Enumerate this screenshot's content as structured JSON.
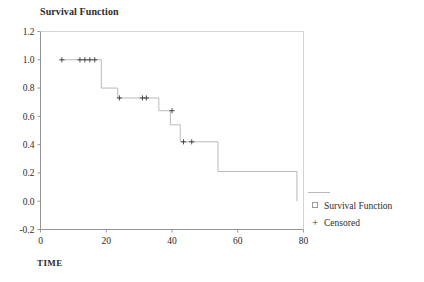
{
  "chart": {
    "title": "Survival Function",
    "xlabel": "TIME",
    "ylabel": ""
  },
  "legend": {
    "series_label": "Survival Function",
    "censored_label": "Censored",
    "censored_symbol": "+",
    "position": "right"
  },
  "axes": {
    "x_ticks": [
      "0",
      "20",
      "40",
      "60",
      "80"
    ],
    "y_ticks": [
      "1.2",
      "1.0",
      "0.8",
      "0.6",
      "0.4",
      "0.2",
      "0.0",
      "-0.2"
    ]
  },
  "colors": {
    "line": "#b9b9b9",
    "axis": "#8a8a8a",
    "marker": "#3a3a3a",
    "text": "#2b2b2b",
    "background": "#ffffff"
  },
  "chart_data": {
    "type": "line",
    "subtype": "kaplan-meier-step",
    "title": "Survival Function",
    "xlabel": "TIME",
    "ylabel": "",
    "xlim": [
      0,
      80
    ],
    "ylim": [
      -0.2,
      1.2
    ],
    "grid": false,
    "legend_position": "right",
    "series": [
      {
        "name": "Survival Function",
        "step": "post",
        "x": [
          6.0,
          18.5,
          23.5,
          36.0,
          39.5,
          42.5,
          43.5,
          54.0,
          78.0,
          78.0
        ],
        "y": [
          1.0,
          1.0,
          0.8,
          0.73,
          0.64,
          0.54,
          0.42,
          0.42,
          0.21,
          0.0
        ],
        "points": [
          {
            "time": 6.0,
            "survival": 1.0
          },
          {
            "time": 18.5,
            "survival": 1.0
          },
          {
            "time": 18.5,
            "survival": 0.8
          },
          {
            "time": 23.5,
            "survival": 0.8
          },
          {
            "time": 23.5,
            "survival": 0.73
          },
          {
            "time": 36.0,
            "survival": 0.73
          },
          {
            "time": 36.0,
            "survival": 0.64
          },
          {
            "time": 39.5,
            "survival": 0.64
          },
          {
            "time": 39.5,
            "survival": 0.54
          },
          {
            "time": 42.5,
            "survival": 0.54
          },
          {
            "time": 42.5,
            "survival": 0.42
          },
          {
            "time": 54.0,
            "survival": 0.42
          },
          {
            "time": 54.0,
            "survival": 0.21
          },
          {
            "time": 78.0,
            "survival": 0.21
          },
          {
            "time": 78.0,
            "survival": 0.0
          }
        ]
      }
    ],
    "censored": {
      "name": "Censored",
      "marker": "+",
      "points": [
        {
          "time": 6.5,
          "survival": 1.0
        },
        {
          "time": 12.0,
          "survival": 1.0
        },
        {
          "time": 13.5,
          "survival": 1.0
        },
        {
          "time": 15.0,
          "survival": 1.0
        },
        {
          "time": 16.5,
          "survival": 1.0
        },
        {
          "time": 24.0,
          "survival": 0.73
        },
        {
          "time": 31.0,
          "survival": 0.73
        },
        {
          "time": 32.2,
          "survival": 0.73
        },
        {
          "time": 40.0,
          "survival": 0.64
        },
        {
          "time": 43.5,
          "survival": 0.42
        },
        {
          "time": 46.0,
          "survival": 0.42
        }
      ]
    }
  }
}
